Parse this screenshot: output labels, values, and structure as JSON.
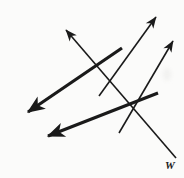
{
  "figure": {
    "type": "geometry-line-diagram",
    "width": 184,
    "height": 178,
    "background_color": "#fbfbfa",
    "stroke_color": "#1a1a1a",
    "labels": [
      {
        "id": "w",
        "text": "W",
        "style": "italic-bold-serif",
        "x": 165,
        "y": 160,
        "attached_to": "thin-arrow-down-right-tail"
      }
    ],
    "arrows": [
      {
        "id": "thin-arrow-upper-left",
        "name": "thin-ray-to-upper-left",
        "weight": "thin",
        "stroke_width": 1.6,
        "x1": 176,
        "y1": 158,
        "x2": 66,
        "y2": 30,
        "head_at": "end",
        "head_direction": "up-left"
      },
      {
        "id": "thin-arrow-upper-right-1",
        "name": "thin-ray-to-upper-right-upper",
        "weight": "thin",
        "stroke_width": 1.6,
        "x1": 99,
        "y1": 96,
        "x2": 156,
        "y2": 17,
        "head_at": "end",
        "head_direction": "up-right"
      },
      {
        "id": "thin-arrow-upper-right-2",
        "name": "thin-ray-to-upper-right-lower",
        "weight": "thin",
        "stroke_width": 1.6,
        "x1": 119,
        "y1": 133,
        "x2": 173,
        "y2": 41,
        "head_at": "end",
        "head_direction": "up-right"
      },
      {
        "id": "thick-arrow-lower-left-1",
        "name": "thick-ray-to-lower-left-upper",
        "weight": "thick",
        "stroke_width": 3.2,
        "x1": 122,
        "y1": 48,
        "x2": 28,
        "y2": 112,
        "head_at": "end",
        "head_direction": "down-left"
      },
      {
        "id": "thick-arrow-lower-left-2",
        "name": "thick-ray-to-lower-left-lower",
        "weight": "thick",
        "stroke_width": 3.2,
        "x1": 158,
        "y1": 93,
        "x2": 48,
        "y2": 136,
        "head_at": "end",
        "head_direction": "down-left"
      }
    ],
    "intersections": [
      {
        "id": "x1",
        "x": 100,
        "y": 67
      },
      {
        "id": "x2",
        "x": 119,
        "y": 101
      }
    ]
  }
}
